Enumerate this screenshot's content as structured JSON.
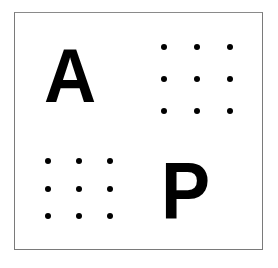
{
  "panel": {
    "top_left": {
      "type": "letter",
      "text": "A"
    },
    "top_right": {
      "type": "dot-grid",
      "rows": 3,
      "cols": 3,
      "x": [
        164,
        197,
        230
      ],
      "y": [
        47,
        79,
        111
      ]
    },
    "bottom_left": {
      "type": "dot-grid",
      "rows": 3,
      "cols": 3,
      "x": [
        48,
        79,
        110
      ],
      "y": [
        161,
        189,
        216
      ]
    },
    "bottom_right": {
      "type": "letter",
      "text": "P"
    }
  }
}
